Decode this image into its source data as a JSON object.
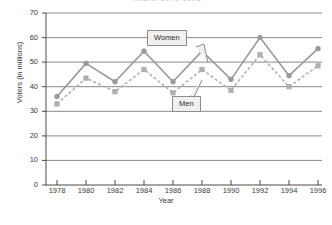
{
  "chart_data": {
    "type": "line",
    "title": "Voters: 1978-1996",
    "xlabel": "Year",
    "ylabel": "Voters (in millions)",
    "categories": [
      "1978",
      "1980",
      "1982",
      "1984",
      "1986",
      "1988",
      "1990",
      "1992",
      "1994",
      "1996"
    ],
    "ylim": [
      0,
      70
    ],
    "yticks": [
      "0",
      "10",
      "20",
      "30",
      "40",
      "50",
      "60",
      "70"
    ],
    "grid": "horizontal",
    "legend_position": "inline-callouts",
    "series": [
      {
        "name": "Women",
        "style": "solid",
        "marker": "circle",
        "color": "#9a9a9a",
        "values": [
          36,
          49.5,
          42,
          54.5,
          42,
          54.5,
          43,
          60,
          44.5,
          55.5
        ]
      },
      {
        "name": "Men",
        "style": "dashed",
        "marker": "square",
        "color": "#b0b0b0",
        "values": [
          33,
          43.5,
          38,
          47,
          37.5,
          47,
          38.5,
          53,
          40,
          48.5
        ]
      }
    ],
    "annotations": [
      {
        "text": "Women",
        "points_to_series": "Women",
        "points_to_category": "1988"
      },
      {
        "text": "Men",
        "points_to_series": "Men",
        "points_to_category": "1988"
      }
    ]
  },
  "axis": {
    "y_title": "Voters (in millions)",
    "x_title": "Year"
  },
  "colors": {
    "women_line": "#9a9a9a",
    "men_line": "#b0b0b0",
    "axis": "#4a4a4a",
    "grid": "#7a7a7a",
    "callout_fill": "#f0f0f0",
    "callout_border": "#8d8d8d"
  }
}
